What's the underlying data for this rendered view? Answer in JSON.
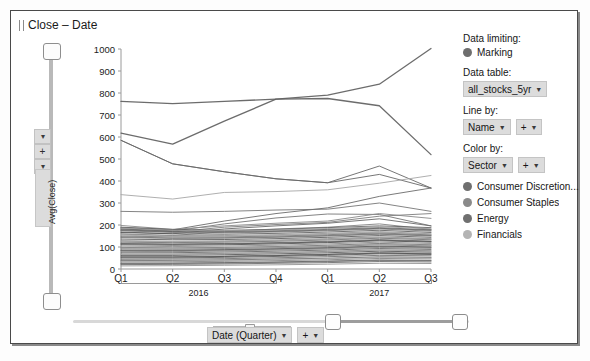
{
  "window": {
    "title": "Close – Date"
  },
  "yaxis": {
    "label": "Avg(Close)",
    "plus": "+",
    "ticks": [
      "1000",
      "900",
      "800",
      "700",
      "600",
      "500",
      "400",
      "300",
      "200",
      "100",
      "0"
    ]
  },
  "xaxis": {
    "ticks": [
      "Q1",
      "Q2",
      "Q3",
      "Q4",
      "Q1",
      "Q2",
      "Q3"
    ],
    "groups": [
      "2016",
      "2017"
    ],
    "selector_label": "Date (Quarter)",
    "plus": "+"
  },
  "panel": {
    "data_limiting_label": "Data limiting:",
    "marking_label": "Marking",
    "data_table_label": "Data table:",
    "data_table_value": "all_stocks_5yr",
    "line_by_label": "Line by:",
    "line_by_value": "Name",
    "line_by_plus": "+",
    "color_by_label": "Color by:",
    "color_by_value": "Sector",
    "color_by_plus": "+",
    "legend": [
      {
        "label": "Consumer Discretion...",
        "color": "#6f6f6f"
      },
      {
        "label": "Consumer Staples",
        "color": "#8a8a8a"
      },
      {
        "label": "Energy",
        "color": "#707070"
      },
      {
        "label": "Financials",
        "color": "#b4b4b4"
      }
    ]
  },
  "colors": {
    "marking_dot": "#6e6e6e",
    "axis": "#9a9a9a",
    "plot_border": "#bdbdbd"
  },
  "chart_data": {
    "type": "line",
    "title": "Close – Date",
    "xlabel": "Date (Quarter)",
    "ylabel": "Avg(Close)",
    "ylim": [
      0,
      1000
    ],
    "grid": false,
    "legend_position": "right",
    "x": [
      "2016 Q1",
      "2016 Q2",
      "2016 Q3",
      "2016 Q4",
      "2017 Q1",
      "2017 Q2",
      "2017 Q3"
    ],
    "series": [
      {
        "name": "PCLN",
        "color": "#5f5f5f",
        "width": 1.3,
        "values": [
          762,
          752,
          762,
          772,
          775,
          742,
          520
        ]
      },
      {
        "name": "AMZN",
        "color": "#5f5f5f",
        "width": 1.3,
        "values": [
          618,
          568,
          672,
          772,
          790,
          840,
          1002
        ]
      },
      {
        "name": "GOOGL",
        "color": "#6a6a6a",
        "width": 1.0,
        "values": [
          585,
          478,
          442,
          410,
          392,
          430,
          368
        ]
      },
      {
        "name": "REGN",
        "color": "#6a6a6a",
        "width": 1.0,
        "values": [
          585,
          478,
          442,
          410,
          392,
          468,
          368
        ]
      },
      {
        "name": "EQIX",
        "color": "#a8a8a8",
        "width": 1.0,
        "values": [
          338,
          318,
          348,
          352,
          360,
          390,
          425
        ]
      },
      {
        "name": "ISRG",
        "color": "#7a7a7a",
        "width": 1.0,
        "values": [
          262,
          258,
          262,
          268,
          272,
          300,
          262
        ]
      },
      {
        "name": "BLK",
        "color": "#6f6f6f",
        "width": 1.0,
        "values": [
          188,
          178,
          218,
          252,
          278,
          330,
          368
        ]
      },
      {
        "name": "AZO",
        "color": "#787878",
        "width": 1.0,
        "values": [
          182,
          172,
          205,
          232,
          250,
          248,
          196
        ]
      },
      {
        "name": "CMG",
        "color": "#8c8c8c",
        "width": 1.0,
        "values": [
          198,
          180,
          196,
          208,
          218,
          252,
          230
        ]
      },
      {
        "name": "AMG",
        "color": "#808080",
        "width": 1.0,
        "values": [
          175,
          168,
          190,
          202,
          212,
          240,
          252
        ]
      },
      {
        "name": "MTD",
        "color": "#6d6d6d",
        "width": 1.0,
        "values": [
          168,
          160,
          182,
          196,
          208,
          228,
          196
        ]
      },
      {
        "name": "ORLY",
        "color": "#858585",
        "width": 1.0,
        "values": [
          160,
          152,
          170,
          182,
          190,
          205,
          180
        ]
      },
      {
        "name": "band-01",
        "color": "#5a5a5a",
        "width": 0.9,
        "values": [
          190,
          180,
          176,
          180,
          188,
          196,
          188
        ]
      },
      {
        "name": "band-02",
        "color": "#6b6b6b",
        "width": 0.9,
        "values": [
          182,
          174,
          170,
          174,
          180,
          188,
          178
        ]
      },
      {
        "name": "band-03",
        "color": "#7c7c7c",
        "width": 0.9,
        "values": [
          174,
          166,
          164,
          168,
          174,
          182,
          172
        ]
      },
      {
        "name": "band-04",
        "color": "#555555",
        "width": 0.9,
        "values": [
          166,
          160,
          158,
          162,
          168,
          176,
          166
        ]
      },
      {
        "name": "band-05",
        "color": "#8e8e8e",
        "width": 0.9,
        "values": [
          158,
          152,
          152,
          156,
          162,
          170,
          160
        ]
      },
      {
        "name": "band-06",
        "color": "#646464",
        "width": 0.9,
        "values": [
          150,
          146,
          146,
          150,
          156,
          164,
          155
        ]
      },
      {
        "name": "band-07",
        "color": "#757575",
        "width": 0.9,
        "values": [
          143,
          139,
          140,
          144,
          150,
          158,
          150
        ]
      },
      {
        "name": "band-08",
        "color": "#4f4f4f",
        "width": 0.9,
        "values": [
          136,
          133,
          134,
          138,
          144,
          152,
          144
        ]
      },
      {
        "name": "band-09",
        "color": "#888888",
        "width": 0.9,
        "values": [
          129,
          126,
          128,
          132,
          138,
          146,
          138
        ]
      },
      {
        "name": "band-10",
        "color": "#5e5e5e",
        "width": 0.9,
        "values": [
          122,
          120,
          122,
          126,
          132,
          140,
          133
        ]
      },
      {
        "name": "band-11",
        "color": "#717171",
        "width": 0.9,
        "values": [
          116,
          114,
          116,
          120,
          126,
          134,
          127
        ]
      },
      {
        "name": "band-12",
        "color": "#4a4a4a",
        "width": 0.9,
        "values": [
          110,
          108,
          110,
          114,
          120,
          128,
          122
        ]
      },
      {
        "name": "band-13",
        "color": "#828282",
        "width": 0.9,
        "values": [
          104,
          102,
          104,
          108,
          114,
          122,
          116
        ]
      },
      {
        "name": "band-14",
        "color": "#5c5c5c",
        "width": 0.9,
        "values": [
          98,
          96,
          98,
          102,
          108,
          116,
          110
        ]
      },
      {
        "name": "band-15",
        "color": "#6e6e6e",
        "width": 0.9,
        "values": [
          92,
          90,
          93,
          97,
          102,
          110,
          105
        ]
      },
      {
        "name": "band-16",
        "color": "#464646",
        "width": 0.9,
        "values": [
          86,
          85,
          88,
          92,
          97,
          104,
          100
        ]
      },
      {
        "name": "band-17",
        "color": "#7e7e7e",
        "width": 0.9,
        "values": [
          80,
          79,
          82,
          86,
          91,
          98,
          94
        ]
      },
      {
        "name": "band-18",
        "color": "#585858",
        "width": 0.9,
        "values": [
          74,
          74,
          77,
          81,
          86,
          93,
          89
        ]
      },
      {
        "name": "band-19",
        "color": "#6a6a6a",
        "width": 0.9,
        "values": [
          68,
          68,
          71,
          75,
          80,
          87,
          83
        ]
      },
      {
        "name": "band-20",
        "color": "#424242",
        "width": 0.9,
        "values": [
          62,
          62,
          65,
          69,
          74,
          81,
          77
        ]
      },
      {
        "name": "band-21",
        "color": "#7a7a7a",
        "width": 0.9,
        "values": [
          56,
          56,
          59,
          63,
          68,
          75,
          72
        ]
      },
      {
        "name": "band-22",
        "color": "#545454",
        "width": 0.9,
        "values": [
          50,
          50,
          53,
          57,
          62,
          69,
          66
        ]
      },
      {
        "name": "band-23",
        "color": "#666666",
        "width": 0.9,
        "values": [
          44,
          45,
          47,
          51,
          56,
          62,
          60
        ]
      },
      {
        "name": "band-24",
        "color": "#3e3e3e",
        "width": 0.9,
        "values": [
          38,
          39,
          41,
          45,
          49,
          55,
          53
        ]
      },
      {
        "name": "band-25",
        "color": "#767676",
        "width": 0.9,
        "values": [
          32,
          33,
          35,
          38,
          42,
          48,
          46
        ]
      },
      {
        "name": "band-26",
        "color": "#505050",
        "width": 0.9,
        "values": [
          26,
          27,
          29,
          32,
          36,
          41,
          39
        ]
      },
      {
        "name": "band-27",
        "color": "#626262",
        "width": 0.9,
        "values": [
          20,
          21,
          23,
          26,
          29,
          34,
          32
        ]
      },
      {
        "name": "band-28",
        "color": "#8a8a8a",
        "width": 0.9,
        "values": [
          14,
          15,
          17,
          19,
          22,
          26,
          25
        ]
      },
      {
        "name": "band-29",
        "color": "#9a9a9a",
        "width": 0.9,
        "values": [
          186,
          176,
          173,
          177,
          184,
          192,
          183
        ]
      },
      {
        "name": "band-30",
        "color": "#a2a2a2",
        "width": 0.9,
        "values": [
          154,
          148,
          149,
          153,
          159,
          167,
          158
        ]
      },
      {
        "name": "band-31",
        "color": "#989898",
        "width": 0.9,
        "values": [
          126,
          123,
          125,
          129,
          135,
          143,
          136
        ]
      },
      {
        "name": "band-32",
        "color": "#9e9e9e",
        "width": 0.9,
        "values": [
          96,
          94,
          96,
          100,
          105,
          113,
          108
        ]
      },
      {
        "name": "band-33",
        "color": "#a4a4a4",
        "width": 0.9,
        "values": [
          66,
          66,
          69,
          73,
          78,
          85,
          81
        ]
      },
      {
        "name": "band-34",
        "color": "#ababab",
        "width": 0.9,
        "values": [
          36,
          37,
          39,
          43,
          47,
          52,
          50
        ]
      },
      {
        "name": "band-35",
        "color": "#606060",
        "width": 0.9,
        "values": [
          178,
          170,
          167,
          171,
          177,
          185,
          176
        ]
      },
      {
        "name": "band-36",
        "color": "#707070",
        "width": 0.9,
        "values": [
          146,
          141,
          142,
          146,
          152,
          160,
          152
        ]
      },
      {
        "name": "band-37",
        "color": "#505050",
        "width": 0.9,
        "values": [
          114,
          112,
          114,
          118,
          123,
          131,
          125
        ]
      },
      {
        "name": "band-38",
        "color": "#686868",
        "width": 0.9,
        "values": [
          84,
          83,
          86,
          90,
          95,
          102,
          98
        ]
      },
      {
        "name": "band-39",
        "color": "#484848",
        "width": 0.9,
        "values": [
          54,
          54,
          57,
          61,
          66,
          72,
          69
        ]
      },
      {
        "name": "band-40",
        "color": "#727272",
        "width": 0.9,
        "values": [
          24,
          25,
          27,
          30,
          34,
          39,
          37
        ]
      }
    ]
  }
}
